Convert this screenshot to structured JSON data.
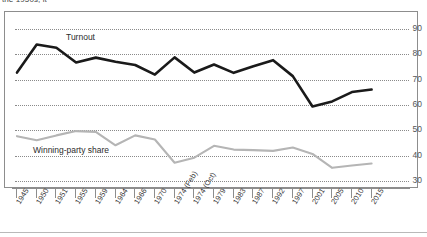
{
  "caption": "the 1950s, it",
  "chart_data": {
    "type": "line",
    "title": "",
    "subtitle": "",
    "xlabel": "",
    "ylabel": "",
    "ylim": [
      30,
      95
    ],
    "yticks": [
      90,
      80,
      70,
      60,
      50,
      40,
      30
    ],
    "grid": true,
    "legend_position": "inline-labels",
    "categories": [
      "1945",
      "1950",
      "1951",
      "1955",
      "1959",
      "1964",
      "1966",
      "1970",
      "1974 (Feb)",
      "1974 (Oct)",
      "1979",
      "1983",
      "1987",
      "1992",
      "1997",
      "2001",
      "2005",
      "2010",
      "2015"
    ],
    "series": [
      {
        "name": "Turnout",
        "color": "#1a1a1a",
        "values": [
          72.8,
          83.9,
          82.6,
          76.8,
          78.7,
          77.1,
          75.8,
          72.0,
          78.8,
          72.8,
          76.0,
          72.7,
          75.3,
          77.7,
          71.4,
          59.4,
          61.4,
          65.1,
          66.1
        ]
      },
      {
        "name": "Winning-party share",
        "color": "#b5b5b5",
        "values": [
          47.7,
          46.1,
          48.0,
          49.7,
          49.4,
          44.1,
          48.0,
          46.4,
          37.2,
          39.2,
          43.9,
          42.4,
          42.2,
          41.9,
          43.2,
          40.7,
          35.2,
          36.1,
          36.9
        ]
      }
    ]
  }
}
